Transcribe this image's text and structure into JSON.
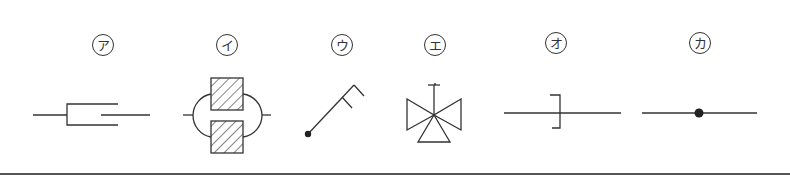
{
  "diagram": {
    "type": "pipe-symbol-legend",
    "symbols": [
      {
        "label": "ア",
        "shape": "flexible-joint"
      },
      {
        "label": "イ",
        "shape": "strainer-or-fitting"
      },
      {
        "label": "ウ",
        "shape": "hose-reel"
      },
      {
        "label": "エ",
        "shape": "three-way-valve"
      },
      {
        "label": "オ",
        "shape": "blind-flange"
      },
      {
        "label": "カ",
        "shape": "pipe-junction"
      }
    ],
    "colors": {
      "stroke": "#333333",
      "background": "#ffffff"
    }
  }
}
